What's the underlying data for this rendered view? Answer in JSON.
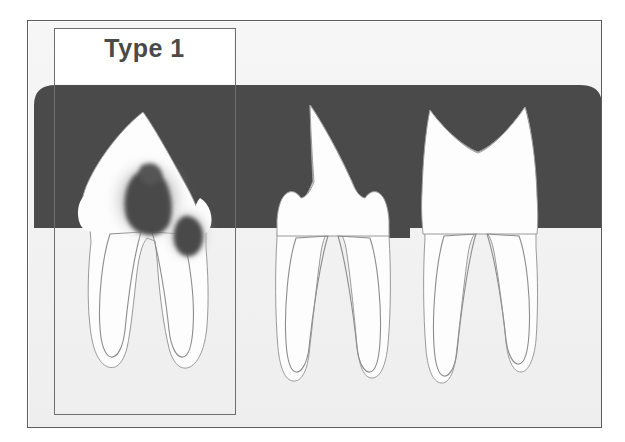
{
  "figure": {
    "kind": "dental-radiograph-illustration",
    "caption_label": "Type 1",
    "frame": {
      "x": 27,
      "y": 20,
      "width": 575,
      "height": 408,
      "border_color": "#5b5b5b"
    },
    "callout": {
      "label": "Type 1",
      "x": 54,
      "y": 28,
      "width": 182,
      "height": 387,
      "border_color": "#6e6e6e",
      "label_color": "#4a4a4a",
      "label_font_size_px": 25
    },
    "colors": {
      "background": "#ffffff",
      "bone_dark_field": "#4a4a4a",
      "gingiva_light": "#f2f2f2",
      "tooth_fill": "#fdfdfd",
      "tooth_outline": "#8d8d8d",
      "pulp_outline": "#7a7a7a",
      "caries_dark": "#4a4a4a",
      "caries_halo": "#cfcfcf"
    },
    "regions": [
      {
        "name": "dark-bone-field",
        "description": "dark gray rounded block occupying upper area",
        "top": 85,
        "bottom": 228,
        "left": 34,
        "right": 602
      },
      {
        "name": "light-gingiva-field",
        "description": "light gray lower area below gum line",
        "top": 228,
        "bottom": 426
      }
    ],
    "teeth": [
      {
        "index": 1,
        "name": "tooth-type-1",
        "crown_shape": "single-pointed-triangular-cusp",
        "apex_x": 143,
        "apex_y": 112,
        "roots": 2,
        "has_caries": true,
        "caries_lesions": [
          {
            "name": "occlusal-caries-lesion",
            "cx": 148,
            "cy": 202,
            "rx": 24,
            "ry": 30
          },
          {
            "name": "proximal-caries-lesion",
            "cx": 188,
            "cy": 235,
            "rx": 14,
            "ry": 18
          }
        ],
        "highlighted": true
      },
      {
        "index": 2,
        "name": "tooth-type-2",
        "crown_shape": "pointed-cusp-with-shoulder-bumps",
        "apex_x": 310,
        "apex_y": 105,
        "roots": 2,
        "has_caries": false,
        "highlighted": false
      },
      {
        "index": 3,
        "name": "tooth-type-3",
        "crown_shape": "two-cusp-m-shape-with-v-notch",
        "apex_left_x": 430,
        "apex_left_y": 110,
        "apex_right_x": 525,
        "apex_right_y": 107,
        "notch_x": 478,
        "notch_y": 152,
        "roots": 2,
        "has_caries": false,
        "highlighted": false
      }
    ]
  }
}
